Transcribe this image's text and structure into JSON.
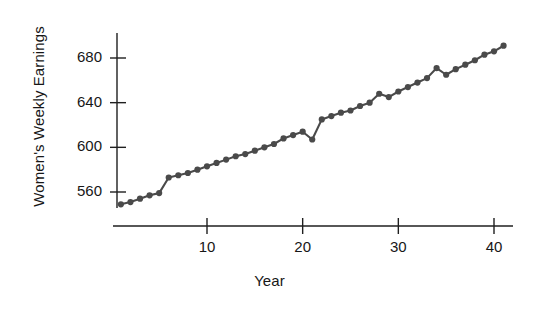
{
  "chart_data": {
    "type": "line",
    "title": "",
    "subtitle": "",
    "xlabel": "Year",
    "ylabel": "Women's Weekly Earnings",
    "xlim": [
      0,
      42
    ],
    "ylim": [
      540,
      700
    ],
    "xticks": [
      10,
      20,
      30,
      40
    ],
    "yticks": [
      560,
      600,
      640,
      680
    ],
    "grid": false,
    "legend": null,
    "markers": "filled-circle",
    "series_color": "#4a4a4a",
    "axis_color": "#1f1f1f",
    "background_color": "#ffffff",
    "annotations": [],
    "series": [
      {
        "name": "Women's Weekly Earnings",
        "x": [
          1,
          2,
          3,
          4,
          5,
          6,
          7,
          8,
          9,
          10,
          11,
          12,
          13,
          14,
          15,
          16,
          17,
          18,
          19,
          20,
          21,
          22,
          23,
          24,
          25,
          26,
          27,
          28,
          29,
          30,
          31,
          32,
          33,
          34,
          35,
          36,
          37,
          38,
          39,
          40,
          41
        ],
        "values": [
          549,
          551,
          554,
          557,
          559,
          573,
          575,
          577,
          580,
          583,
          586,
          589,
          592,
          594,
          597,
          600,
          603,
          608,
          611,
          614,
          607,
          625,
          628,
          631,
          633,
          637,
          640,
          648,
          645,
          650,
          654,
          658,
          662,
          671,
          665,
          670,
          674,
          678,
          683,
          686,
          691
        ]
      }
    ]
  },
  "axis": {
    "x_ticks": [
      {
        "label": "10",
        "value": 10
      },
      {
        "label": "20",
        "value": 20
      },
      {
        "label": "30",
        "value": 30
      },
      {
        "label": "40",
        "value": 40
      }
    ],
    "y_ticks": [
      {
        "label": "680",
        "value": 680
      },
      {
        "label": "640",
        "value": 640
      },
      {
        "label": "600",
        "value": 600
      },
      {
        "label": "560",
        "value": 560
      }
    ]
  }
}
